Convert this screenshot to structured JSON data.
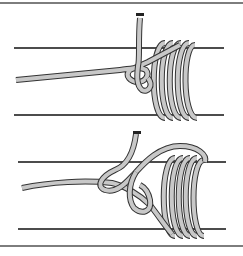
{
  "figure": {
    "panels": [
      {
        "label": "step-1",
        "description": "Line wrapped in coils around a pole with loose end tucked through a loop"
      },
      {
        "label": "step-2",
        "description": "Loop opened, loose end passing through before tightening"
      }
    ]
  },
  "colors": {
    "rope_fill": "#c8c8c8",
    "rope_outline": "#333333",
    "pole_line": "#111111",
    "frame": "#7d7d7d",
    "tag_end": "#222222"
  }
}
